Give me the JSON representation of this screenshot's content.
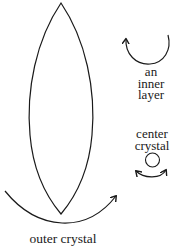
{
  "diagram": {
    "type": "crystal-rotation-illustration",
    "stroke_color": "#1a1a1a",
    "background_color": "#ffffff",
    "shapes": {
      "outer_crystal_shape": "vesica (pointed lens)",
      "center_crystal_shape": "circle",
      "inner_layer_arrow": "clockwise arc with arrowhead at upper-left",
      "center_crystal_arrow": "double-headed arc beneath circle",
      "outer_crystal_arrow": "wide arc beneath lens with arrowhead at right"
    },
    "labels": {
      "inner_layer": {
        "line1": "an",
        "line2": "inner",
        "line3": "layer"
      },
      "center_crystal": {
        "line1": "center",
        "line2": "crystal"
      },
      "outer_crystal": "outer crystal"
    }
  }
}
